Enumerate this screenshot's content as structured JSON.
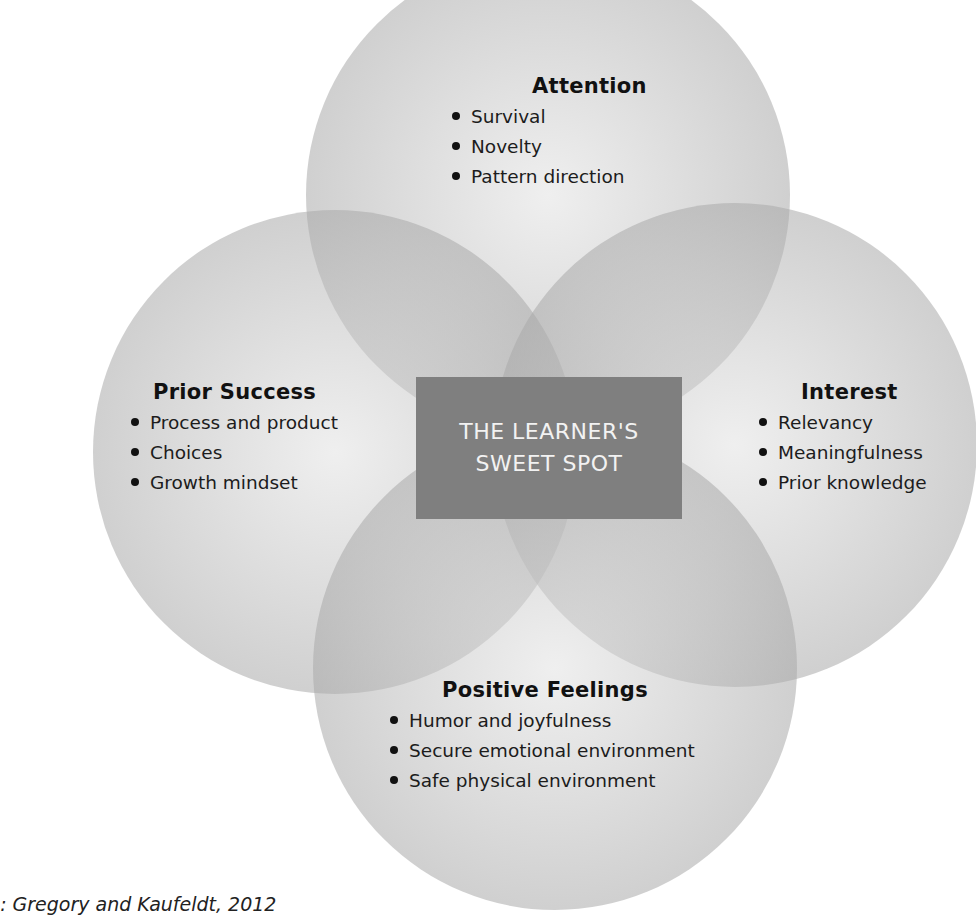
{
  "diagram": {
    "type": "venn",
    "center": {
      "label_line1": "THE LEARNER'S",
      "label_line2": "SWEET SPOT"
    },
    "circles": [
      {
        "id": "attention",
        "title": "Attention",
        "items": [
          "Survival",
          "Novelty",
          "Pattern direction"
        ]
      },
      {
        "id": "prior-success",
        "title": "Prior Success",
        "items": [
          "Process and product",
          "Choices",
          "Growth mindset"
        ]
      },
      {
        "id": "interest",
        "title": "Interest",
        "items": [
          "Relevancy",
          "Meaningfulness",
          "Prior knowledge"
        ]
      },
      {
        "id": "positive-feelings",
        "title": "Positive Feelings",
        "items": [
          "Humor and joyfulness",
          "Secure emotional environment",
          "Safe physical environment"
        ]
      }
    ],
    "colors": {
      "circle_fill": "#bdbdbd",
      "center_box": "#7f7f7f",
      "center_text": "#f2f2f2"
    }
  },
  "source": "ce: Gregory and Kaufeldt, 2012"
}
